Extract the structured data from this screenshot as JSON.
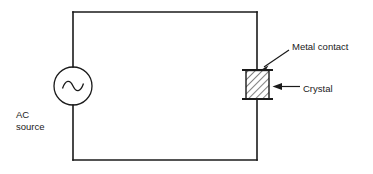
{
  "diagram": {
    "background_color": "#ffffff",
    "line_color": "#1a1a1a",
    "labels": {
      "metal_contact": "Metal contact",
      "crystal": "Crystal",
      "ac_source_line1": "AC",
      "ac_source_line2": "source"
    },
    "components": {
      "ac_source": {
        "name": "AC source",
        "symbol": "sine-wave-in-circle",
        "center_x": 73,
        "center_y": 86,
        "radius": 19
      },
      "crystal": {
        "name": "Crystal",
        "symbol": "hatched-rectangle",
        "x": 246,
        "y": 71,
        "width": 23,
        "height": 27,
        "fill": "diagonal-hatch"
      },
      "metal_contacts": {
        "name": "Metal contact",
        "symbol": "horizontal-bar",
        "count": 2,
        "top_y": 70,
        "bottom_y": 99,
        "x_start": 242,
        "x_end": 273
      },
      "circuit_loop": {
        "name": "wire loop",
        "left": 73,
        "top": 12,
        "right": 257,
        "bottom": 160
      }
    },
    "annotations": [
      {
        "name": "metal-contact-leader",
        "target": "top metal contact bar",
        "arrow": "down-left"
      },
      {
        "name": "crystal-leader",
        "target": "crystal body",
        "arrow": "left"
      }
    ]
  }
}
